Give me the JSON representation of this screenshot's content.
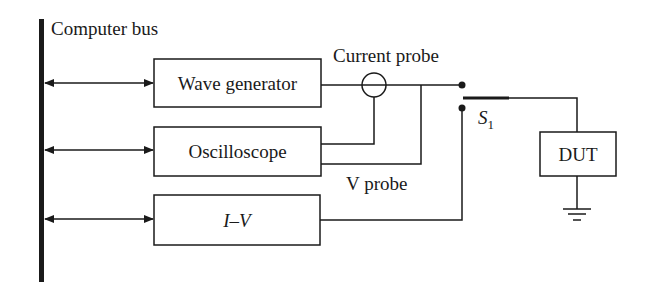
{
  "diagram": {
    "bus_label": "Computer bus",
    "blocks": [
      {
        "id": "wave-generator",
        "label": "Wave generator"
      },
      {
        "id": "oscilloscope",
        "label": "Oscilloscope"
      },
      {
        "id": "iv",
        "label": "I–V"
      }
    ],
    "current_probe_label": "Current probe",
    "v_probe_label": "V probe",
    "switch_label": "S",
    "switch_subscript": "1",
    "dut_label": "DUT",
    "colors": {
      "line": "#1a1a1a",
      "background": "#ffffff"
    }
  }
}
